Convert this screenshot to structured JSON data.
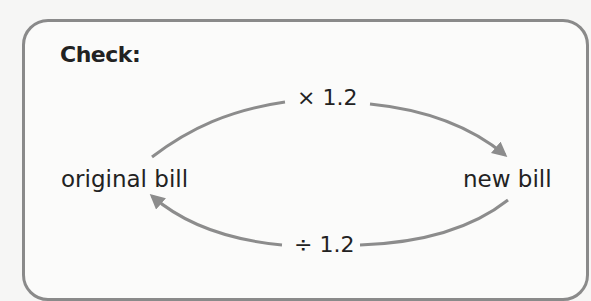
{
  "title": "Check:",
  "nodes": {
    "left": "original bill",
    "right": "new bill"
  },
  "operations": {
    "forward": "× 1.2",
    "backward": "÷ 1.2"
  },
  "colors": {
    "border": "#8a8a8a",
    "arrow": "#8c8c8c",
    "text": "#222222",
    "background": "#fbfbfa"
  }
}
